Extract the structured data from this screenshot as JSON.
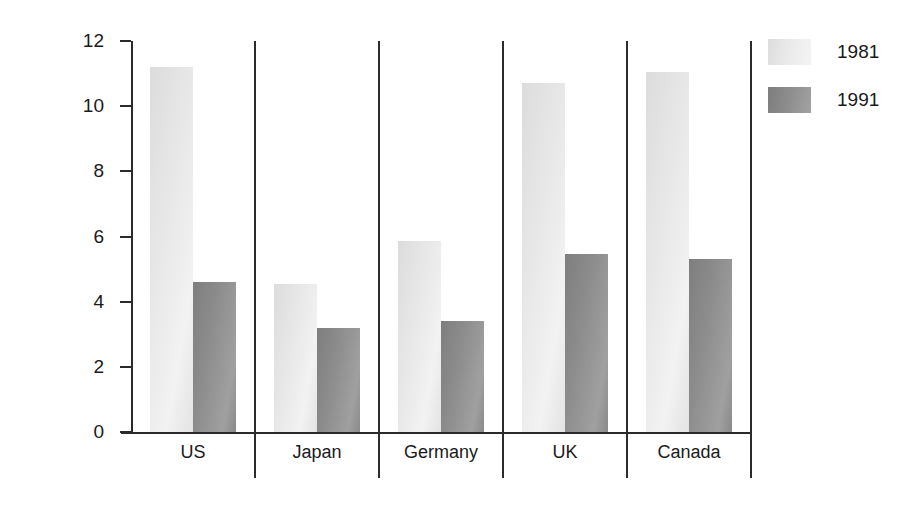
{
  "chart_data": {
    "type": "bar",
    "title": "",
    "xlabel": "",
    "ylabel": "Inflation Rate",
    "categories": [
      "US",
      "Japan",
      "Germany",
      "UK",
      "Canada"
    ],
    "series": [
      {
        "name": "1981",
        "color": "#e9e9e9",
        "values": [
          11.2,
          4.55,
          5.85,
          10.7,
          11.05
        ]
      },
      {
        "name": "1991",
        "color": "#8d8d8d",
        "values": [
          4.6,
          3.2,
          3.4,
          5.45,
          5.3
        ]
      }
    ],
    "ylim": [
      0,
      12
    ],
    "yticks": [
      0,
      2,
      4,
      6,
      8,
      10,
      12
    ],
    "ytick_labels": [
      "0",
      "2",
      "4",
      "6",
      "8",
      "10",
      "12"
    ],
    "grid": false,
    "legend_position": "right",
    "legend_entries": [
      "1981",
      "1991"
    ],
    "category_separators": true
  },
  "colors": {
    "axis": "#2b2b2b",
    "background": "#ffffff",
    "text": "#1a1a1a",
    "series_1981": "#e9e9e9",
    "series_1991": "#8d8d8d"
  }
}
